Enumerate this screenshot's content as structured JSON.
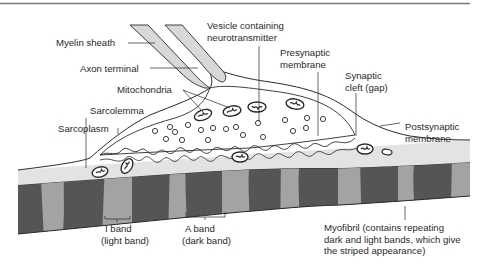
{
  "diagram": {
    "colors": {
      "line": "#2a2a2a",
      "myelin_fill": "#d8d8d8",
      "sarcoplasm_fill": "#e2e2e2",
      "dark_band": "#505050",
      "light_band": "#a0a0a0",
      "top_rule": "#888888"
    },
    "labels": {
      "myelin_sheath": "Myelin sheath",
      "axon_terminal": "Axon terminal",
      "mitochondria": "Mitochondria",
      "sarcolemma": "Sarcolemma",
      "sarcoplasm": "Sarcoplasm",
      "vesicle_line1": "Vesicle containing",
      "vesicle_line2": "neurotransmitter",
      "presynaptic_line1": "Presynaptic",
      "presynaptic_line2": "membrane",
      "cleft_line1": "Synaptic",
      "cleft_line2": "cleft (gap)",
      "postsynaptic_line1": "Postsynaptic",
      "postsynaptic_line2": "membrane",
      "i_band_line1": "I band",
      "i_band_line2": "(light band)",
      "a_band_line1": "A band",
      "a_band_line2": "(dark band)",
      "myofibril_line1": "Myofibril (contains repeating",
      "myofibril_line2": "dark and light bands, which give",
      "myofibril_line3": "the striped appearance)"
    }
  }
}
